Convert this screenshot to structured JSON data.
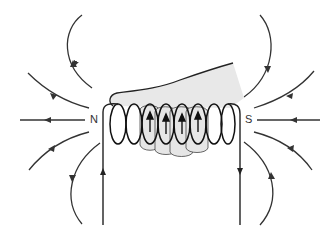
{
  "diagram": {
    "type": "solenoid-right-hand-grip-rule",
    "labels": {
      "north": "N",
      "south": "S"
    },
    "colors": {
      "line": "#333333",
      "hand_fill": "#e6e6e6",
      "hand_outline": "#222222",
      "background": "#ffffff"
    },
    "elements": {
      "solenoid_turns": 8,
      "finger_arrows": 4,
      "field_lines_left": 5,
      "field_lines_right": 5,
      "current_in_direction": "up (left wire)",
      "current_out_direction": "down (right wire)"
    }
  }
}
